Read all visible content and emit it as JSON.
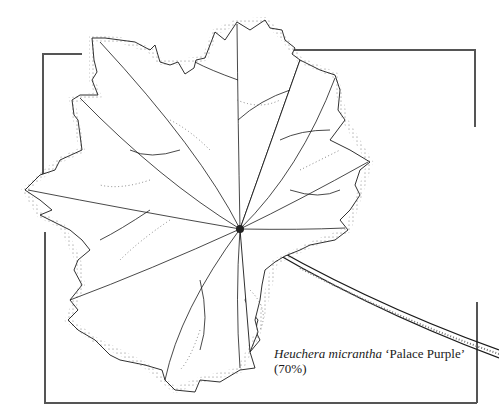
{
  "illustration": {
    "subject": "botanical line drawing of a lobed leaf with stem",
    "species_italic": "Heuchera micrantha",
    "cultivar": "‘Palace Purple’",
    "scale": "(70%)",
    "colors": {
      "line": "#1a1a1a",
      "frame": "#555555",
      "background": "#ffffff"
    }
  }
}
